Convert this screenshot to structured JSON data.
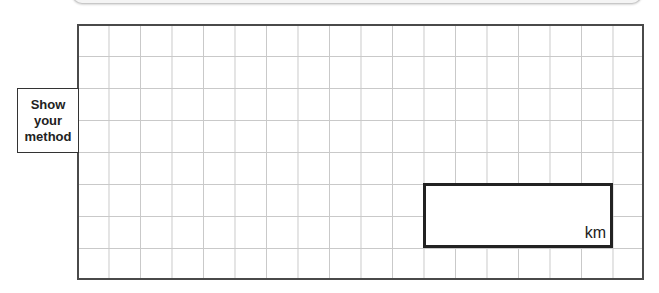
{
  "prompt_box": {
    "lines": [
      "Show",
      "your",
      "method"
    ]
  },
  "working_grid": {
    "columns": 18,
    "rows": 8,
    "grid_color": "#c9c9c9",
    "border_color": "#4a4a4a"
  },
  "answer_box": {
    "value": "",
    "unit": "km"
  }
}
